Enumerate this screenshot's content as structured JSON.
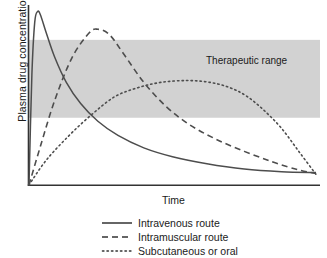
{
  "chart_data": {
    "type": "line",
    "title": "",
    "xlabel": "Time",
    "ylabel": "Plasma drug concentration",
    "grid": false,
    "axis_ticks": false,
    "xlim": [
      0,
      100
    ],
    "ylim": [
      0,
      100
    ],
    "legend_position": "below",
    "annotations": [
      {
        "name": "therapeutic-range-band",
        "label": "Therapeutic range",
        "type": "horizontal-band",
        "y_low": 38,
        "y_high": 82,
        "color": "#d2d2d2"
      }
    ],
    "series": [
      {
        "name": "Intravenous route",
        "style": "solid",
        "color": "#4d4d4d",
        "x": [
          0,
          1,
          2,
          3,
          4,
          6,
          9,
          13,
          18,
          24,
          31,
          40,
          50,
          62,
          75,
          88,
          100
        ],
        "y": [
          0,
          62,
          92,
          98,
          96,
          86,
          72,
          58,
          46,
          36,
          28,
          21,
          16,
          12,
          9,
          7.5,
          7
        ]
      },
      {
        "name": "Intramuscular route",
        "style": "dashed",
        "color": "#4d4d4d",
        "x": [
          0,
          4,
          9,
          15,
          21,
          24,
          28,
          33,
          40,
          48,
          56,
          65,
          75,
          85,
          94,
          100
        ],
        "y": [
          0,
          22,
          48,
          72,
          86,
          88,
          85,
          74,
          58,
          44,
          34,
          26,
          19,
          13,
          8.5,
          6.5
        ]
      },
      {
        "name": "Subcutaneous or oral",
        "style": "dotted",
        "color": "#4d4d4d",
        "x": [
          0,
          6,
          14,
          22,
          30,
          38,
          46,
          55,
          63,
          70,
          76,
          82,
          88,
          94,
          100
        ],
        "y": [
          0,
          14,
          28,
          40,
          50,
          55,
          58,
          59,
          58,
          55,
          50,
          42,
          32,
          19,
          6
        ]
      }
    ]
  },
  "legend": {
    "items": [
      {
        "label": "Intravenous route",
        "style": "solid"
      },
      {
        "label": "Intramuscular route",
        "style": "dashed"
      },
      {
        "label": "Subcutaneous or oral",
        "style": "dotted"
      }
    ]
  },
  "axes": {
    "x_axis_label": "Time",
    "y_axis_label": "Plasma drug concentration",
    "axis_color": "#333333"
  }
}
